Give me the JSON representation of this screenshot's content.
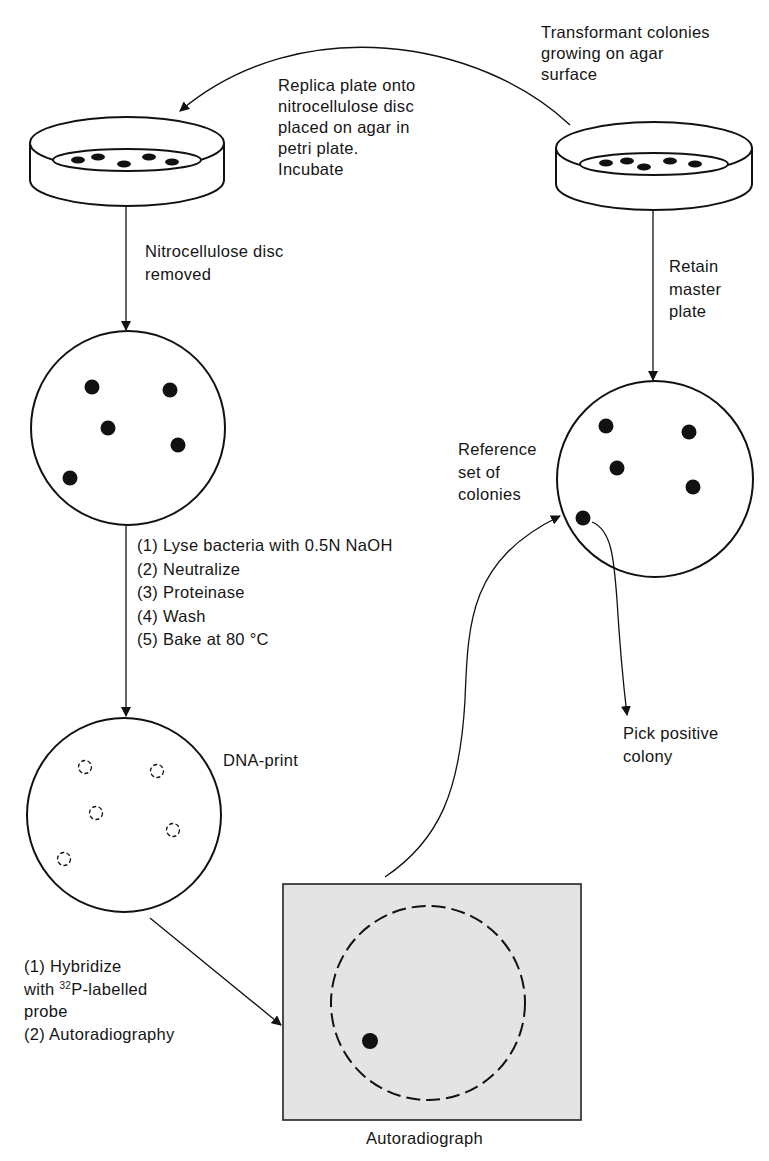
{
  "colors": {
    "ink": "#111111",
    "autoradiograph_fill": "#e4e4e4",
    "background": "#ffffff"
  },
  "labels": {
    "transformant": [
      "Transformant colonies",
      "growing on agar",
      "surface"
    ],
    "replica": [
      "Replica plate onto",
      "nitrocellulose disc",
      "placed on agar in",
      "petri plate.",
      "Incubate"
    ],
    "disc_removed": [
      "Nitrocellulose disc",
      "removed"
    ],
    "retain": [
      "Retain",
      "master",
      "plate"
    ],
    "reference": [
      "Reference",
      "set of",
      "colonies"
    ],
    "lysis_steps": [
      "(1) Lyse bacteria with 0.5N NaOH",
      "(2) Neutralize",
      "(3) Proteinase",
      "(4) Wash",
      "(5) Bake at 80 °C"
    ],
    "dna_print": "DNA-print",
    "pick": [
      "Pick positive",
      "colony"
    ],
    "hybridize": {
      "line1": "(1) Hybridize",
      "line2_prefix": "with ",
      "line2_sup": "32",
      "line2_suffix": "P-labelled",
      "line3": "probe",
      "line4": "(2) Autoradiography"
    },
    "autoradiograph": "Autoradiograph"
  },
  "nodes": {
    "replica_dish": {
      "cx": 127,
      "cy": 143,
      "rx": 97,
      "ry": 26,
      "depth": 37
    },
    "master_dish": {
      "cx": 654,
      "cy": 148,
      "rx": 98,
      "ry": 26,
      "depth": 36
    },
    "nitro_disc": {
      "cx": 128,
      "cy": 428,
      "r": 97,
      "colonies": [
        [
          92,
          387
        ],
        [
          170,
          390
        ],
        [
          108,
          428
        ],
        [
          178,
          445
        ],
        [
          70,
          478
        ]
      ]
    },
    "dna_print_disc": {
      "cx": 124,
      "cy": 815,
      "r": 97,
      "prints": [
        [
          85,
          767
        ],
        [
          157,
          771
        ],
        [
          96,
          813
        ],
        [
          173,
          830
        ],
        [
          64,
          859
        ]
      ]
    },
    "reference_plate": {
      "cx": 655,
      "cy": 479,
      "r": 98,
      "colonies": [
        [
          606,
          426
        ],
        [
          689,
          432
        ],
        [
          617,
          468
        ],
        [
          693,
          487
        ],
        [
          583,
          518
        ]
      ]
    },
    "autoradiograph_film": {
      "x": 283,
      "y": 884,
      "w": 298,
      "h": 236,
      "disc": {
        "cx": 428,
        "cy": 1003,
        "r": 97
      },
      "signal": [
        370,
        1041
      ]
    }
  }
}
